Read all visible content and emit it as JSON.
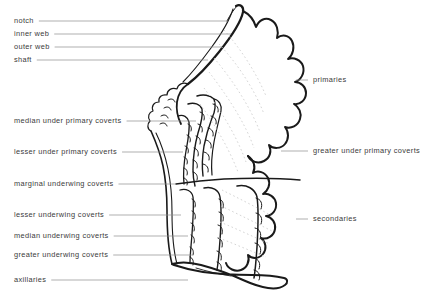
{
  "figure": {
    "background_color": "#ffffff",
    "ink_color": "#1a1a1a",
    "leader_color": "#8c8c8c",
    "label_color": "#3a3a3a"
  },
  "labels_left": [
    {
      "text": "notch",
      "x": 14,
      "y": 22,
      "leader_x2": 228
    },
    {
      "text": "inner web",
      "x": 14,
      "y": 35,
      "leader_x2": 231
    },
    {
      "text": "outer web",
      "x": 14,
      "y": 48,
      "leader_x2": 222
    },
    {
      "text": "shaft",
      "x": 14,
      "y": 61,
      "leader_x2": 208
    },
    {
      "text": "median under primary coverts",
      "x": 14,
      "y": 122,
      "leader_x2": 196
    },
    {
      "text": "lesser under primary coverts",
      "x": 14,
      "y": 153,
      "leader_x2": 183
    },
    {
      "text": "marginal underwing  coverts",
      "x": 14,
      "y": 185,
      "leader_x2": 176
    },
    {
      "text": "lesser underwing  coverts",
      "x": 14,
      "y": 216,
      "leader_x2": 181
    },
    {
      "text": "median underwing  coverts",
      "x": 14,
      "y": 237,
      "leader_x2": 188
    },
    {
      "text": "greater  underwing  coverts",
      "x": 14,
      "y": 256,
      "leader_x2": 192
    },
    {
      "text": "axillaries",
      "x": 14,
      "y": 281,
      "leader_x2": 188
    }
  ],
  "labels_right": [
    {
      "text": "primaries",
      "x": 313,
      "y": 81,
      "leader_x1": 296
    },
    {
      "text": "greater under primary coverts",
      "x": 313,
      "y": 152,
      "leader_x1": 281
    },
    {
      "text": "secondaries",
      "x": 313,
      "y": 220,
      "leader_x1": 296
    }
  ]
}
